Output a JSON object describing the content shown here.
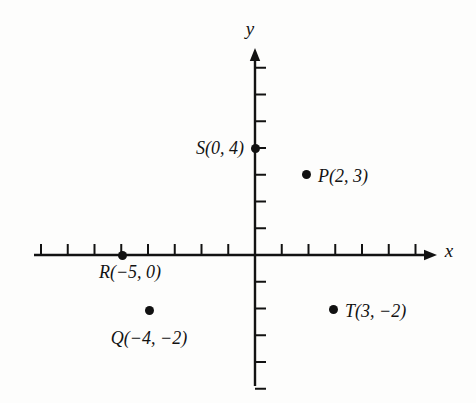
{
  "figure": {
    "type": "coordinate-plane",
    "background_color": "#fdfdfc",
    "ink_color": "#121212",
    "origin_px": {
      "x": 255,
      "y": 255
    },
    "unit_px": 26.75
  },
  "axes": {
    "x": {
      "label": "x",
      "label_pos_px": {
        "x": 449,
        "y": 250
      },
      "line_start_px": {
        "x": 34,
        "y": 255
      },
      "line_end_px": {
        "x": 437,
        "y": 255
      },
      "tick_values": [
        -8,
        -7,
        -6,
        -5,
        -4,
        -3,
        -2,
        -1,
        1,
        2,
        3,
        4,
        5,
        6
      ],
      "tick_length_px": 11,
      "arrow": "right"
    },
    "y": {
      "label": "y",
      "label_pos_px": {
        "x": 250,
        "y": 28
      },
      "line_start_px": {
        "x": 255,
        "y": 48
      },
      "line_end_px": {
        "x": 255,
        "y": 386
      },
      "tick_values": [
        7,
        6,
        5,
        4,
        3,
        2,
        1,
        -1,
        -2,
        -3,
        -4,
        -5
      ],
      "tick_length_px": 11,
      "arrow": "up"
    }
  },
  "chart_data": {
    "type": "scatter",
    "title": "",
    "xlabel": "x",
    "ylabel": "y",
    "xlim": [
      -8.3,
      6.8
    ],
    "ylim": [
      -4.9,
      7.7
    ],
    "grid": false,
    "legend": "none",
    "points": [
      {
        "name": "P",
        "label": "P(2, 3)",
        "x": 2,
        "y": 3,
        "px": {
          "x": 306,
          "y": 174
        },
        "label_px": {
          "x": 318,
          "y": 176
        },
        "label_anchor": "left"
      },
      {
        "name": "Q",
        "label": "Q(−4, −2)",
        "x": -4,
        "y": -2,
        "px": {
          "x": 149,
          "y": 310
        },
        "label_px": {
          "x": 149,
          "y": 338
        },
        "label_anchor": "center"
      },
      {
        "name": "R",
        "label": "R(−5, 0)",
        "x": -5,
        "y": 0,
        "px": {
          "x": 122,
          "y": 255
        },
        "label_px": {
          "x": 130,
          "y": 272
        },
        "label_anchor": "center"
      },
      {
        "name": "S",
        "label": "S(0, 4)",
        "x": 0,
        "y": 4,
        "px": {
          "x": 255,
          "y": 148
        },
        "label_px": {
          "x": 244,
          "y": 148
        },
        "label_anchor": "right"
      },
      {
        "name": "T",
        "label": "T(3, −2)",
        "x": 3,
        "y": -2,
        "px": {
          "x": 333,
          "y": 309
        },
        "label_px": {
          "x": 345,
          "y": 311
        },
        "label_anchor": "left"
      }
    ]
  }
}
